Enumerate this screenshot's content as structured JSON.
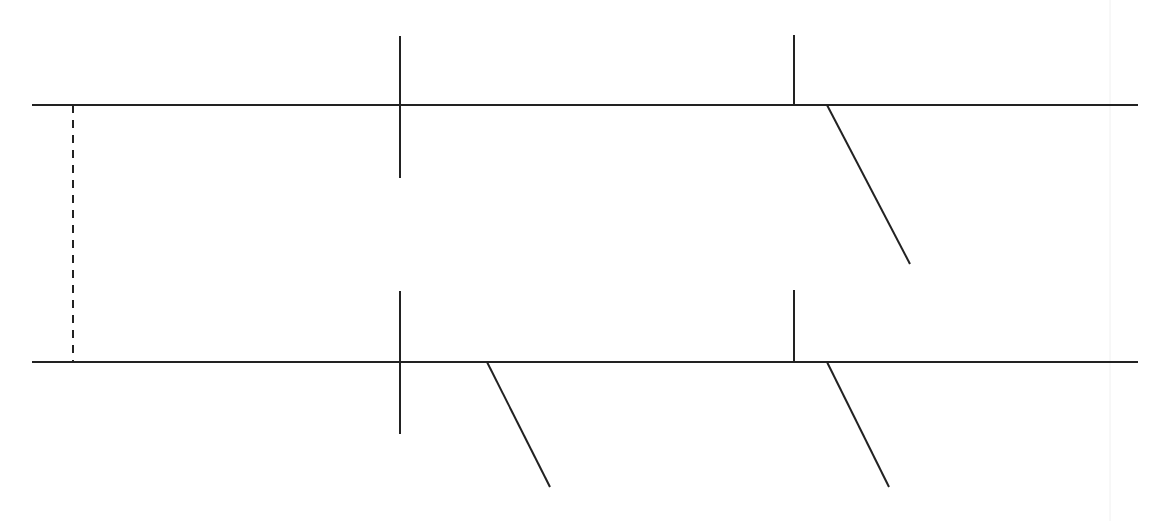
{
  "canvas": {
    "width": 1162,
    "height": 521,
    "background": "#ffffff"
  },
  "style": {
    "stroke": "#222222",
    "stroke_width": 2,
    "guide_color": "#f0f0f0"
  },
  "diagram": {
    "lines": [
      {
        "id": "top-rail",
        "x1": 32,
        "y1": 105,
        "x2": 1138,
        "y2": 105
      },
      {
        "id": "bottom-rail",
        "x1": 32,
        "y1": 362,
        "x2": 1138,
        "y2": 362
      },
      {
        "id": "top-cross-tick",
        "x1": 400,
        "y1": 36,
        "x2": 400,
        "y2": 178
      },
      {
        "id": "top-right-tick",
        "x1": 794,
        "y1": 35,
        "x2": 794,
        "y2": 105
      },
      {
        "id": "top-right-branch",
        "x1": 827,
        "y1": 105,
        "x2": 910,
        "y2": 264
      },
      {
        "id": "bottom-cross-tick",
        "x1": 400,
        "y1": 291,
        "x2": 400,
        "y2": 434
      },
      {
        "id": "bottom-mid-branch",
        "x1": 487,
        "y1": 362,
        "x2": 550,
        "y2": 487
      },
      {
        "id": "bottom-right-tick",
        "x1": 794,
        "y1": 290,
        "x2": 794,
        "y2": 362
      },
      {
        "id": "bottom-right-branch",
        "x1": 827,
        "y1": 362,
        "x2": 889,
        "y2": 487
      }
    ],
    "dashed_lines": [
      {
        "id": "left-connector",
        "x1": 73,
        "y1": 105,
        "x2": 73,
        "y2": 362,
        "dash": "8,7"
      }
    ],
    "guides": [
      {
        "id": "faint-right-guide",
        "x1": 1110,
        "y1": 0,
        "x2": 1110,
        "y2": 521
      }
    ]
  }
}
